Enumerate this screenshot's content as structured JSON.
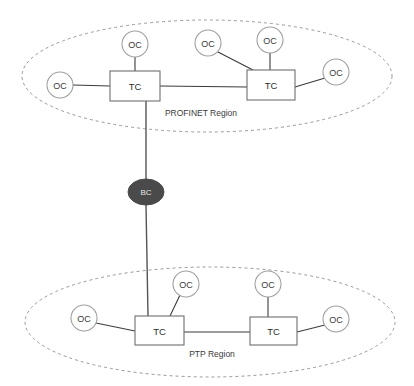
{
  "diagram": {
    "type": "network-topology",
    "title": "",
    "background_color": "#ffffff",
    "regions": [
      {
        "id": "profinet",
        "label": "PROFINET Region",
        "label_x": 201,
        "label_y": 113,
        "shape": "dashed-ellipse",
        "cx": 207,
        "cy": 76,
        "rx": 185,
        "ry": 56,
        "stroke_color": "#9a9a9a"
      },
      {
        "id": "ptp",
        "label": "PTP Region",
        "label_x": 212,
        "label_y": 354,
        "shape": "dashed-ellipse",
        "cx": 210,
        "cy": 322,
        "rx": 185,
        "ry": 55,
        "stroke_color": "#9a9a9a"
      }
    ],
    "nodes": [
      {
        "id": "tc-pn-left",
        "label": "TC",
        "shape": "box",
        "x": 110,
        "y": 71,
        "w": 50,
        "h": 30,
        "region": "profinet"
      },
      {
        "id": "tc-pn-right",
        "label": "TC",
        "shape": "box",
        "x": 247,
        "y": 70,
        "w": 48,
        "h": 30,
        "region": "profinet"
      },
      {
        "id": "oc-pn-1",
        "label": "OC",
        "shape": "circle",
        "cx": 135,
        "cy": 44,
        "r": 13,
        "region": "profinet"
      },
      {
        "id": "oc-pn-2",
        "label": "OC",
        "shape": "circle",
        "cx": 60,
        "cy": 85,
        "r": 13,
        "region": "profinet"
      },
      {
        "id": "oc-pn-3",
        "label": "OC",
        "shape": "circle",
        "cx": 208,
        "cy": 43,
        "r": 13,
        "region": "profinet"
      },
      {
        "id": "oc-pn-4",
        "label": "OC",
        "shape": "circle",
        "cx": 270,
        "cy": 40,
        "r": 13,
        "region": "profinet"
      },
      {
        "id": "oc-pn-5",
        "label": "OC",
        "shape": "circle",
        "cx": 336,
        "cy": 72,
        "r": 13,
        "region": "profinet"
      },
      {
        "id": "bc-bridge",
        "label": "BC",
        "shape": "ellipse",
        "cx": 146,
        "cy": 192,
        "rx": 18,
        "ry": 13,
        "region": "between",
        "fill": "#4a4a4a"
      },
      {
        "id": "tc-ptp-left",
        "label": "TC",
        "shape": "box",
        "x": 135,
        "y": 316,
        "w": 49,
        "h": 29,
        "region": "ptp"
      },
      {
        "id": "tc-ptp-right",
        "label": "TC",
        "shape": "box",
        "x": 250,
        "y": 317,
        "w": 47,
        "h": 28,
        "region": "ptp"
      },
      {
        "id": "oc-ptp-1",
        "label": "OC",
        "shape": "circle",
        "cx": 84,
        "cy": 318,
        "r": 13,
        "region": "ptp"
      },
      {
        "id": "oc-ptp-2",
        "label": "OC",
        "shape": "circle",
        "cx": 186,
        "cy": 284,
        "r": 13,
        "region": "ptp"
      },
      {
        "id": "oc-ptp-3",
        "label": "OC",
        "shape": "circle",
        "cx": 268,
        "cy": 284,
        "r": 13,
        "region": "ptp"
      },
      {
        "id": "oc-ptp-4",
        "label": "OC",
        "shape": "circle",
        "cx": 336,
        "cy": 319,
        "r": 13,
        "region": "ptp"
      }
    ],
    "links": [
      {
        "id": "link-ocpn1-tcpnleft",
        "from": "oc-pn-1",
        "to": "tc-pn-left",
        "x1": 135,
        "y1": 57,
        "x2": 135,
        "y2": 71
      },
      {
        "id": "link-ocpn2-tcpnleft",
        "from": "oc-pn-2",
        "to": "tc-pn-left",
        "x1": 73,
        "y1": 85,
        "x2": 110,
        "y2": 86
      },
      {
        "id": "link-tcpnleft-tcpnright",
        "from": "tc-pn-left",
        "to": "tc-pn-right",
        "x1": 160,
        "y1": 86,
        "x2": 247,
        "y2": 87
      },
      {
        "id": "link-ocpn3-tcpnright",
        "from": "oc-pn-3",
        "to": "tc-pn-right",
        "x1": 218,
        "y1": 52,
        "x2": 253,
        "y2": 70
      },
      {
        "id": "link-ocpn4-tcpnright",
        "from": "oc-pn-4",
        "to": "tc-pn-right",
        "x1": 270,
        "y1": 53,
        "x2": 270,
        "y2": 70
      },
      {
        "id": "link-ocpn5-tcpnright",
        "from": "oc-pn-5",
        "to": "tc-pn-right",
        "x1": 325,
        "y1": 78,
        "x2": 295,
        "y2": 87
      },
      {
        "id": "link-tcpnleft-bc",
        "from": "tc-pn-left",
        "to": "bc-bridge",
        "x1": 146,
        "y1": 101,
        "x2": 146,
        "y2": 179
      },
      {
        "id": "link-bc-tcptpleft",
        "from": "bc-bridge",
        "to": "tc-ptp-left",
        "x1": 146,
        "y1": 205,
        "x2": 148,
        "y2": 316
      },
      {
        "id": "link-ocptp1-tcptpleft",
        "from": "oc-ptp-1",
        "to": "tc-ptp-left",
        "x1": 96,
        "y1": 323,
        "x2": 135,
        "y2": 331
      },
      {
        "id": "link-ocptp2-tcptpleft",
        "from": "oc-ptp-2",
        "to": "tc-ptp-left",
        "x1": 180,
        "y1": 295,
        "x2": 170,
        "y2": 316
      },
      {
        "id": "link-tcptpleft-tcptpright",
        "from": "tc-ptp-left",
        "to": "tc-ptp-right",
        "x1": 184,
        "y1": 332,
        "x2": 250,
        "y2": 332
      },
      {
        "id": "link-ocptp3-tcptpright",
        "from": "oc-ptp-3",
        "to": "tc-ptp-right",
        "x1": 268,
        "y1": 297,
        "x2": 268,
        "y2": 317
      },
      {
        "id": "link-ocptp4-tcptpright",
        "from": "oc-ptp-4",
        "to": "tc-ptp-right",
        "x1": 325,
        "y1": 325,
        "x2": 297,
        "y2": 332
      }
    ]
  }
}
